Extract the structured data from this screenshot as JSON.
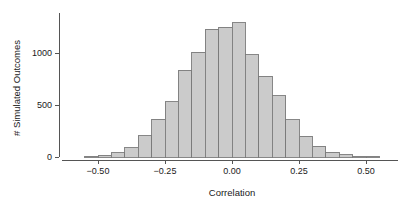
{
  "chart_data": {
    "type": "bar",
    "title": "",
    "subtitle": "",
    "xlabel": "Correlation",
    "ylabel": "# Simulated Outcomes",
    "xlim": [
      -0.575,
      0.575
    ],
    "ylim": [
      0,
      1330
    ],
    "grid": false,
    "legend": null,
    "bin_width": 0.05,
    "xticks": [
      -0.5,
      -0.25,
      0,
      0.25,
      0.5
    ],
    "xticklabels": [
      "-0.50",
      "-0.25",
      "0.00",
      "0.25",
      "0.50"
    ],
    "yticks": [
      0,
      500,
      1000
    ],
    "yticklabels": [
      "0",
      "500",
      "1000"
    ],
    "bin_centers": [
      -0.525,
      -0.475,
      -0.425,
      -0.375,
      -0.325,
      -0.275,
      -0.225,
      -0.175,
      -0.125,
      -0.075,
      -0.025,
      0.025,
      0.075,
      0.125,
      0.175,
      0.225,
      0.275,
      0.325,
      0.375,
      0.425,
      0.475,
      0.525
    ],
    "bin_edges": [
      -0.55,
      -0.5,
      -0.45,
      -0.4,
      -0.35,
      -0.3,
      -0.25,
      -0.2,
      -0.15,
      -0.1,
      -0.05,
      0.0,
      0.05,
      0.1,
      0.15,
      0.2,
      0.25,
      0.3,
      0.35,
      0.4,
      0.45,
      0.5,
      0.55
    ],
    "categories": [
      "-0.525",
      "-0.475",
      "-0.425",
      "-0.375",
      "-0.325",
      "-0.275",
      "-0.225",
      "-0.175",
      "-0.125",
      "-0.075",
      "-0.025",
      "0.025",
      "0.075",
      "0.125",
      "0.175",
      "0.225",
      "0.275",
      "0.325",
      "0.375",
      "0.425",
      "0.475",
      "0.525"
    ],
    "values": [
      5,
      15,
      40,
      90,
      205,
      365,
      530,
      835,
      1005,
      1230,
      1250,
      1290,
      985,
      775,
      590,
      360,
      200,
      105,
      45,
      20,
      8,
      5
    ],
    "bar_fill_color": "#cbcbcb",
    "bar_edge_color": "#7a7a7a",
    "axis_color": "#555555",
    "text_color": "#1a1a1a",
    "background_color": "#ffffff"
  },
  "figure": {
    "caption": ""
  }
}
